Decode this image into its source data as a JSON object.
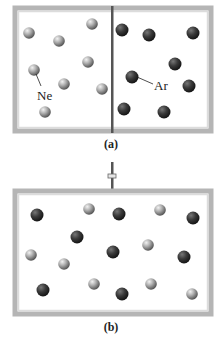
{
  "panels": [
    {
      "id": "a",
      "caption": "(a)",
      "description": "Two gases separated by a partition",
      "has_partition": true,
      "labels": [
        {
          "text": "Ne",
          "gas": "Ne"
        },
        {
          "text": "Ar",
          "gas": "Ar"
        }
      ],
      "left_chamber": {
        "gas": "Ne",
        "count": 8
      },
      "right_chamber": {
        "gas": "Ar",
        "count": 8
      }
    },
    {
      "id": "b",
      "caption": "(b)",
      "description": "Partition removed, gases mixed",
      "has_partition": false,
      "has_stopcock": true,
      "mixed": {
        "Ne": 8,
        "Ar": 8
      }
    }
  ],
  "gases": {
    "Ne": {
      "name": "Neon",
      "color": "#a8a8a8",
      "highlight": "#eeeeee",
      "shade": "#5a5a5a"
    },
    "Ar": {
      "name": "Argon",
      "color": "#3e3e3e",
      "highlight": "#7a7a7a",
      "shade": "#1a1a1a"
    }
  },
  "colors": {
    "frame_outer": "#b8b8b8",
    "frame_inner": "#d8d8d8",
    "partition": "#555555",
    "background": "#ffffff"
  }
}
